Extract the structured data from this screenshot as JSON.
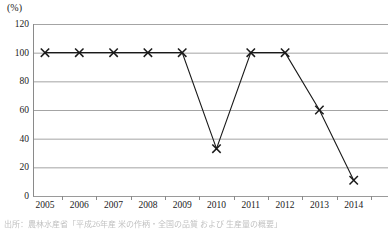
{
  "chart_data": {
    "type": "line",
    "title": "",
    "subtitle": "",
    "xlabel": "",
    "ylabel": "",
    "unit_label": "(%)",
    "categories": [
      "2005",
      "2006",
      "2007",
      "2008",
      "2009",
      "2010",
      "2011",
      "2012",
      "2013",
      "2014"
    ],
    "values": [
      100,
      100,
      100,
      100,
      100,
      33,
      100,
      100,
      60,
      11
    ],
    "series": [
      {
        "name": "",
        "values": [
          100,
          100,
          100,
          100,
          100,
          33,
          100,
          100,
          60,
          11
        ]
      }
    ],
    "ylim": [
      0,
      120
    ],
    "yticks": [
      0,
      20,
      40,
      60,
      80,
      100,
      120
    ],
    "ytick_labels": [
      "0",
      "20",
      "40",
      "60",
      "80",
      "100",
      "120"
    ],
    "xtick_labels": [
      "2005",
      "2006",
      "2007",
      "2008",
      "2009",
      "2010",
      "2011",
      "2012",
      "2013",
      "2014"
    ],
    "grid": true,
    "grid_axis": "y",
    "legend": false,
    "legend_position": "none",
    "marker": "x",
    "line_color": "#1a1a1a",
    "grid_color": "#9a9a9a",
    "axis_color": "#8a8a8a",
    "annotations": []
  },
  "caption": {
    "source_text": "出所：農林水産省「平成26年産 米の作柄・全国の品質 および 生産量の概要」"
  }
}
